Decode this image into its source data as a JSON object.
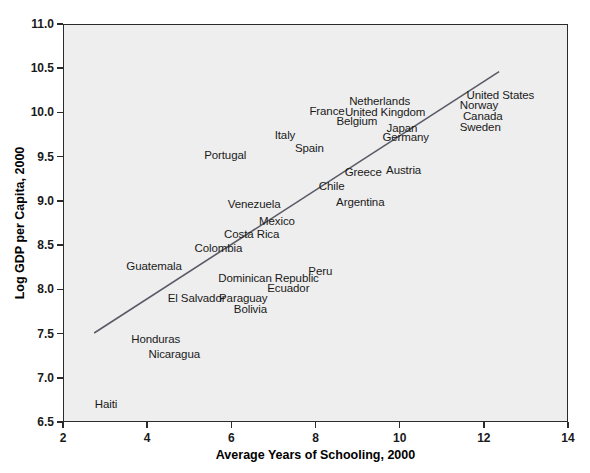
{
  "chart_data": {
    "type": "scatter",
    "title": "",
    "xlabel": "Average Years of Schooling, 2000",
    "ylabel": "Log GDP per Capita, 2000",
    "xlim": [
      2,
      14
    ],
    "ylim": [
      6.5,
      11.0
    ],
    "xticks": [
      2,
      4,
      6,
      8,
      10,
      12,
      14
    ],
    "yticks": [
      6.5,
      7.0,
      7.5,
      8.0,
      8.5,
      9.0,
      9.5,
      10.0,
      10.5,
      11.0
    ],
    "xtick_labels": [
      "2",
      "4",
      "6",
      "8",
      "10",
      "12",
      "14"
    ],
    "ytick_labels": [
      "6.5",
      "7.0",
      "7.5",
      "8.0",
      "8.5",
      "9.0",
      "9.5",
      "10.0",
      "10.5",
      "11.0"
    ],
    "grid": false,
    "legend": null,
    "marker_style": "text-label-only",
    "trendline": {
      "type": "linear",
      "x_start": 2.72,
      "y_start": 7.5,
      "x_end": 12.38,
      "y_end": 10.47,
      "color": "#5a5a66",
      "width": 1.6
    },
    "points": [
      {
        "label": "Haiti",
        "x": 3.0,
        "y": 6.7
      },
      {
        "label": "Nicaragua",
        "x": 4.62,
        "y": 7.27
      },
      {
        "label": "Honduras",
        "x": 4.18,
        "y": 7.44
      },
      {
        "label": "Bolivia",
        "x": 6.43,
        "y": 7.78
      },
      {
        "label": "Paraguay",
        "x": 6.26,
        "y": 7.9
      },
      {
        "label": "El Salvador",
        "x": 5.15,
        "y": 7.9
      },
      {
        "label": "Ecuador",
        "x": 7.33,
        "y": 8.01
      },
      {
        "label": "Dominican Republic",
        "x": 6.86,
        "y": 8.13
      },
      {
        "label": "Peru",
        "x": 8.09,
        "y": 8.21
      },
      {
        "label": "Guatemala",
        "x": 4.14,
        "y": 8.26
      },
      {
        "label": "Colombia",
        "x": 5.67,
        "y": 8.47
      },
      {
        "label": "Costa Rica",
        "x": 6.46,
        "y": 8.62
      },
      {
        "label": "Mexico",
        "x": 7.06,
        "y": 8.77
      },
      {
        "label": "Venezuela",
        "x": 6.52,
        "y": 8.97
      },
      {
        "label": "Argentina",
        "x": 9.04,
        "y": 8.99
      },
      {
        "label": "Chile",
        "x": 8.36,
        "y": 9.17
      },
      {
        "label": "Greece",
        "x": 9.11,
        "y": 9.33
      },
      {
        "label": "Austria",
        "x": 10.07,
        "y": 9.35
      },
      {
        "label": "Portugal",
        "x": 5.83,
        "y": 9.52
      },
      {
        "label": "Spain",
        "x": 7.83,
        "y": 9.6
      },
      {
        "label": "Germany",
        "x": 10.12,
        "y": 9.72
      },
      {
        "label": "Italy",
        "x": 7.25,
        "y": 9.74
      },
      {
        "label": "Japan",
        "x": 10.03,
        "y": 9.82
      },
      {
        "label": "Sweden",
        "x": 11.89,
        "y": 9.83
      },
      {
        "label": "Belgium",
        "x": 8.96,
        "y": 9.9
      },
      {
        "label": "Canada",
        "x": 11.95,
        "y": 9.96
      },
      {
        "label": "United Kingdom",
        "x": 9.63,
        "y": 10.0
      },
      {
        "label": "France",
        "x": 8.25,
        "y": 10.02
      },
      {
        "label": "Norway",
        "x": 11.86,
        "y": 10.08
      },
      {
        "label": "Netherlands",
        "x": 9.5,
        "y": 10.13
      },
      {
        "label": "United States",
        "x": 12.37,
        "y": 10.2
      }
    ]
  },
  "axes": {
    "x_title": "Average Years of Schooling, 2000",
    "y_title": "Log GDP per Capita, 2000"
  },
  "colors": {
    "plot_background": "#eeeeee",
    "page_background": "#ffffff",
    "axis": "#2b2b2b",
    "text": "#1a1a1a",
    "trendline": "#5a5a66"
  }
}
